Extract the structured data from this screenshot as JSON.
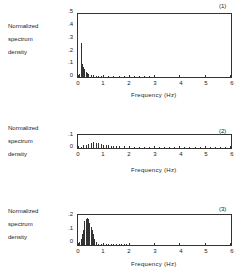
{
  "chart_data": [
    {
      "type": "bar",
      "panel_label": "(1)",
      "title": "",
      "xlabel": "Frequency (Hz)",
      "ylabel": "Normalized spectrum density",
      "xlim": [
        0,
        6
      ],
      "ylim": [
        0,
        0.5
      ],
      "xticks": [
        "0",
        "1",
        "2",
        "3",
        "4",
        "5",
        "6"
      ],
      "yticks": [
        "0",
        ".1",
        ".2",
        ".3",
        ".4",
        ".5"
      ],
      "x": [
        0.05,
        0.1,
        0.15,
        0.2,
        0.25,
        0.3,
        0.35,
        0.4,
        0.5,
        0.6,
        0.7,
        0.8,
        0.9,
        1.0,
        1.2,
        1.4,
        1.6,
        1.8,
        2.0,
        2.2,
        2.4,
        2.6,
        2.8,
        3.0
      ],
      "values": [
        0.02,
        0.27,
        0.1,
        0.08,
        0.06,
        0.04,
        0.03,
        0.02,
        0.015,
        0.012,
        0.01,
        0.01,
        0.008,
        0.008,
        0.007,
        0.007,
        0.006,
        0.006,
        0.006,
        0.006,
        0.006,
        0.006,
        0.006,
        0.005
      ]
    },
    {
      "type": "bar",
      "panel_label": "(2)",
      "title": "",
      "xlabel": "Frequency (Hz)",
      "ylabel": "Normalized spectrum density",
      "xlim": [
        0,
        6
      ],
      "ylim": [
        0,
        0.1
      ],
      "xticks": [
        "0",
        "1",
        "2",
        "3",
        "4",
        "5",
        "6"
      ],
      "yticks": [
        "0",
        ".1"
      ],
      "x": [
        0.1,
        0.2,
        0.3,
        0.4,
        0.5,
        0.6,
        0.7,
        0.8,
        0.9,
        1.0,
        1.1,
        1.2,
        1.3,
        1.4,
        1.5,
        1.6,
        1.8,
        2.0,
        2.2,
        2.4,
        2.6,
        2.8,
        3.0,
        3.2,
        3.4,
        3.6,
        3.8,
        4.0,
        4.2,
        4.4,
        4.6,
        4.8,
        5.0,
        5.2,
        5.4,
        5.6,
        5.8
      ],
      "values": [
        0.01,
        0.02,
        0.025,
        0.03,
        0.035,
        0.045,
        0.04,
        0.035,
        0.03,
        0.025,
        0.022,
        0.02,
        0.018,
        0.016,
        0.015,
        0.013,
        0.012,
        0.01,
        0.01,
        0.009,
        0.009,
        0.009,
        0.009,
        0.008,
        0.008,
        0.008,
        0.008,
        0.008,
        0.008,
        0.01,
        0.008,
        0.008,
        0.008,
        0.007,
        0.007,
        0.007,
        0.007
      ]
    },
    {
      "type": "bar",
      "panel_label": "(3)",
      "title": "",
      "xlabel": "Frequency (Hz)",
      "ylabel": "Normalized spectrum density",
      "xlim": [
        0,
        6
      ],
      "ylim": [
        0,
        0.2
      ],
      "xticks": [
        "0",
        "1",
        "2",
        "3",
        "4",
        "5",
        "6"
      ],
      "yticks": [
        "0",
        ".1",
        ".2"
      ],
      "x": [
        0.05,
        0.1,
        0.15,
        0.2,
        0.25,
        0.3,
        0.35,
        0.4,
        0.45,
        0.5,
        0.55,
        0.6,
        0.65,
        0.7,
        0.8,
        0.9,
        1.0,
        1.1,
        1.2,
        1.3,
        1.4,
        1.5,
        1.6,
        1.7,
        1.8,
        1.9,
        2.0
      ],
      "values": [
        0.02,
        0.04,
        0.07,
        0.1,
        0.16,
        0.17,
        0.18,
        0.17,
        0.15,
        0.12,
        0.1,
        0.07,
        0.04,
        0.02,
        0.01,
        0.008,
        0.008,
        0.007,
        0.008,
        0.01,
        0.009,
        0.008,
        0.008,
        0.007,
        0.006,
        0.005,
        0.005
      ]
    }
  ],
  "panels": [
    {
      "label": "(1)",
      "ylabel_lines": [
        "Normalized",
        "spectrum",
        "density"
      ],
      "yticks": [
        "0",
        ".1",
        ".2",
        ".3",
        ".4",
        ".5"
      ],
      "xticks": [
        "0",
        "1",
        "2",
        "3",
        "4",
        "5",
        "6"
      ],
      "xlabel": "Frequency (Hz)"
    },
    {
      "label": "(2)",
      "ylabel_lines": [
        "Normalized",
        "spectrum",
        "density"
      ],
      "yticks": [
        "0",
        ".1"
      ],
      "xticks": [
        "0",
        "1",
        "2",
        "3",
        "4",
        "5",
        "6"
      ],
      "xlabel": "Frequency (Hz)"
    },
    {
      "label": "(3)",
      "ylabel_lines": [
        "Normalized",
        "spectrum",
        "density"
      ],
      "yticks": [
        "0",
        ".1",
        ".2"
      ],
      "xticks": [
        "0",
        "1",
        "2",
        "3",
        "4",
        "5",
        "6"
      ],
      "xlabel": "Frequency (Hz)"
    }
  ]
}
